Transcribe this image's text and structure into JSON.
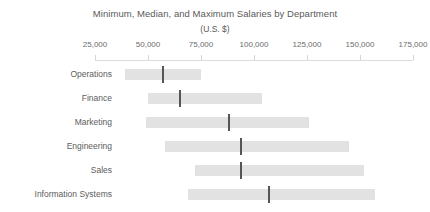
{
  "chart_data": {
    "type": "bar",
    "title": "Minimum, Median, and Maximum Salaries by Department",
    "subtitle": "(U.S. $)",
    "xlabel": "",
    "ylabel": "",
    "xlim": [
      12500,
      187500
    ],
    "grid": false,
    "legend": null,
    "orientation": "horizontal",
    "tick_values": [
      25000,
      50000,
      75000,
      100000,
      125000,
      150000,
      175000
    ],
    "tick_labels": [
      "25,000",
      "50,000",
      "75,000",
      "100,000",
      "125,000",
      "150,000",
      "175,000"
    ],
    "categories": [
      "Operations",
      "Finance",
      "Marketing",
      "Engineering",
      "Sales",
      "Information Systems"
    ],
    "series": [
      {
        "name": "Minimum",
        "values": [
          39000,
          50000,
          49000,
          58000,
          72000,
          69000
        ]
      },
      {
        "name": "Median",
        "values": [
          57000,
          65000,
          88000,
          94000,
          94000,
          107000
        ]
      },
      {
        "name": "Maximum",
        "values": [
          75000,
          104000,
          126000,
          145000,
          152000,
          157000
        ]
      }
    ],
    "rows": [
      {
        "category": "Operations",
        "min": 39000,
        "median": 57000,
        "max": 75000
      },
      {
        "category": "Finance",
        "min": 50000,
        "median": 65000,
        "max": 104000
      },
      {
        "category": "Marketing",
        "min": 49000,
        "median": 88000,
        "max": 126000
      },
      {
        "category": "Engineering",
        "min": 58000,
        "median": 94000,
        "max": 145000
      },
      {
        "category": "Sales",
        "min": 72000,
        "median": 94000,
        "max": 152000
      },
      {
        "category": "Information Systems",
        "min": 69000,
        "median": 107000,
        "max": 157000
      }
    ],
    "colors": {
      "bar": "#e2e2e2",
      "median": "#555555",
      "text": "#5a5a5a",
      "axis": "#dcdcdc",
      "background": "#ffffff"
    }
  }
}
